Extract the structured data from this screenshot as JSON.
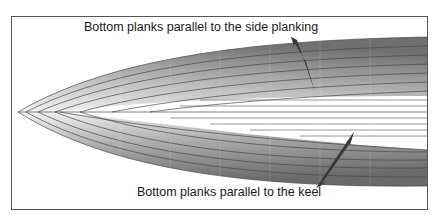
{
  "figure": {
    "type": "hull-planking-diagram",
    "labels": {
      "top": "Bottom planks parallel to the side planking",
      "bottom": "Bottom planks parallel to the keel"
    },
    "colors": {
      "frame": "#555555",
      "plank_line": "#4a4a4a",
      "hull_light": "#f2f2f2",
      "hull_dark": "#6e6e6e",
      "arrow": "#3a3a3a",
      "background": "#ffffff"
    },
    "arrows": [
      {
        "name": "top-arrow",
        "from": [
          291,
          36
        ],
        "to": [
          313,
          92
        ]
      },
      {
        "name": "bottom-arrow",
        "from": [
          318,
          188
        ],
        "to": [
          354,
          133
        ]
      }
    ]
  }
}
